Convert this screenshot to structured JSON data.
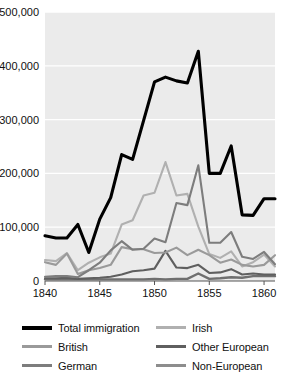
{
  "chart_data": {
    "type": "line",
    "title": "",
    "subtitle": "",
    "xlabel": "",
    "ylabel": "",
    "xlim": [
      1840,
      1861
    ],
    "ylim": [
      0,
      500000
    ],
    "grid": true,
    "grid_color": "#ffffff",
    "plot_background": "#ebebeb",
    "legend_position": "bottom",
    "x": [
      1840,
      1841,
      1842,
      1843,
      1844,
      1845,
      1846,
      1847,
      1848,
      1849,
      1850,
      1851,
      1852,
      1853,
      1854,
      1855,
      1856,
      1857,
      1858,
      1859,
      1860,
      1861
    ],
    "xticks": [
      1840,
      1845,
      1850,
      1855,
      1860
    ],
    "xtick_labels": [
      "1840",
      "1845",
      "1850",
      "1855",
      "1860"
    ],
    "yticks": [
      0,
      100000,
      200000,
      300000,
      400000,
      500000
    ],
    "ytick_labels": [
      "0",
      "100,000",
      "200,000",
      "300,000",
      "400,000",
      "500,000"
    ],
    "series": [
      {
        "name": "Total immigration",
        "color": "#000000",
        "width": 3.1,
        "values": [
          84000,
          80000,
          80000,
          105000,
          53000,
          115000,
          155000,
          235000,
          226000,
          298000,
          370000,
          379000,
          372000,
          368000,
          427000,
          200000,
          200000,
          251000,
          123000,
          122000,
          153000,
          153000
        ]
      },
      {
        "name": "British",
        "color": "#9a9a9a",
        "width": 2.1,
        "values": [
          35000,
          30000,
          51000,
          13000,
          20000,
          24000,
          30000,
          63000,
          59000,
          59000,
          52000,
          53000,
          62000,
          48000,
          58000,
          48000,
          34000,
          40000,
          30000,
          27000,
          30000,
          48000
        ]
      },
      {
        "name": "German",
        "color": "#7d7d7d",
        "width": 2.1,
        "values": [
          8000,
          9000,
          9000,
          7000,
          20000,
          34000,
          57000,
          74000,
          58000,
          60000,
          79000,
          72000,
          145000,
          141000,
          215000,
          71000,
          71000,
          91000,
          45000,
          41000,
          54000,
          31000
        ]
      },
      {
        "name": "Irish",
        "color": "#b0b0b0",
        "width": 2.1,
        "values": [
          39000,
          37000,
          52000,
          20000,
          34000,
          44000,
          51000,
          105000,
          113000,
          159000,
          164000,
          221000,
          159000,
          162000,
          101000,
          50000,
          43000,
          55000,
          27000,
          35000,
          49000,
          27000
        ]
      },
      {
        "name": "Other European",
        "color": "#5f5f5f",
        "width": 2.1,
        "values": [
          5000,
          5000,
          6000,
          4000,
          5000,
          6000,
          8000,
          12000,
          18000,
          20000,
          23000,
          56000,
          25000,
          24000,
          30000,
          15000,
          16000,
          22000,
          12000,
          14000,
          12000,
          12000
        ]
      },
      {
        "name": "Non-European",
        "color": "#6f6f6f",
        "width": 2.4,
        "values": [
          3000,
          3000,
          3000,
          3000,
          3000,
          3000,
          3000,
          3000,
          3000,
          3000,
          4000,
          3000,
          4000,
          4000,
          14000,
          4000,
          5000,
          7000,
          6000,
          9000,
          9000,
          9000
        ]
      }
    ]
  },
  "legend": {
    "items": [
      {
        "label": "Total immigration",
        "color": "#000000",
        "thickness": "4px"
      },
      {
        "label": "Irish",
        "color": "#b0b0b0",
        "thickness": "3px"
      },
      {
        "label": "British",
        "color": "#9a9a9a",
        "thickness": "3px"
      },
      {
        "label": "Other European",
        "color": "#5f5f5f",
        "thickness": "3px"
      },
      {
        "label": "German",
        "color": "#7d7d7d",
        "thickness": "3px"
      },
      {
        "label": "Non-European",
        "color": "#8d8d8d",
        "thickness": "3px"
      }
    ]
  }
}
